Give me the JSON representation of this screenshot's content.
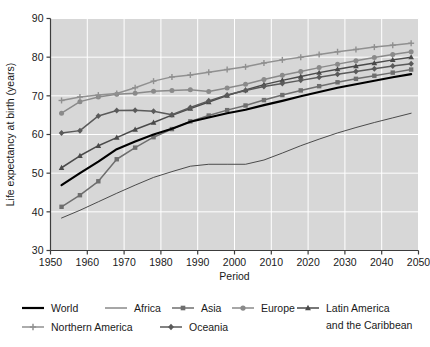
{
  "chart_data": {
    "type": "line",
    "title": "",
    "xlabel": "Period",
    "ylabel": "Life expectancy at birth (years)",
    "xlim": [
      1950,
      2050
    ],
    "ylim": [
      30,
      90
    ],
    "xticks": [
      1950,
      1960,
      1970,
      1980,
      1990,
      2000,
      2010,
      2020,
      2030,
      2040,
      2050
    ],
    "yticks": [
      30,
      40,
      50,
      60,
      70,
      80,
      90
    ],
    "grid": true,
    "legend_position": "bottom",
    "x": [
      1953,
      1958,
      1963,
      1968,
      1973,
      1978,
      1983,
      1988,
      1993,
      1998,
      2003,
      2008,
      2013,
      2018,
      2023,
      2028,
      2033,
      2038,
      2043,
      2048
    ],
    "series": [
      {
        "name": "World",
        "marker": "none",
        "color": "#000000",
        "width": 2.2,
        "values": [
          46.9,
          50.0,
          53.0,
          56.2,
          58.2,
          60.0,
          61.5,
          63.3,
          64.4,
          65.5,
          66.4,
          67.6,
          68.7,
          69.9,
          71.0,
          72.1,
          73.0,
          73.9,
          74.8,
          75.6
        ]
      },
      {
        "name": "Africa",
        "marker": "none",
        "color": "#3a3a3a",
        "width": 0.9,
        "values": [
          38.4,
          40.4,
          42.6,
          44.8,
          46.9,
          48.9,
          50.4,
          51.8,
          52.3,
          52.3,
          52.3,
          53.4,
          55.2,
          57.1,
          58.8,
          60.4,
          61.8,
          63.1,
          64.3,
          65.5
        ]
      },
      {
        "name": "Asia",
        "marker": "square",
        "color": "#6e6e6e",
        "width": 1.5,
        "values": [
          41.3,
          44.3,
          47.9,
          53.6,
          56.6,
          59.3,
          61.4,
          63.4,
          64.9,
          66.3,
          67.5,
          68.9,
          70.2,
          71.4,
          72.5,
          73.5,
          74.4,
          75.2,
          76.0,
          76.8
        ]
      },
      {
        "name": "Europe",
        "marker": "circle",
        "color": "#8a8a8a",
        "width": 1.5,
        "values": [
          65.5,
          68.5,
          69.7,
          70.4,
          70.7,
          71.2,
          71.4,
          71.6,
          71.1,
          72.0,
          73.0,
          74.2,
          75.3,
          76.3,
          77.3,
          78.2,
          79.1,
          79.9,
          80.7,
          81.4
        ]
      },
      {
        "name": "Latin America\nand the Caribbean",
        "marker": "triangle",
        "color": "#4a4a4a",
        "width": 1.5,
        "values": [
          51.4,
          54.5,
          57.1,
          59.2,
          61.3,
          63.1,
          65.0,
          66.7,
          68.4,
          70.1,
          71.5,
          72.9,
          74.0,
          75.0,
          76.0,
          76.9,
          77.7,
          78.5,
          79.3,
          80.0
        ]
      },
      {
        "name": "Northern America",
        "marker": "plus",
        "color": "#909090",
        "width": 1.5,
        "values": [
          68.8,
          69.7,
          70.2,
          70.6,
          72.1,
          73.8,
          74.9,
          75.4,
          76.1,
          76.8,
          77.5,
          78.5,
          79.3,
          80.0,
          80.7,
          81.4,
          82.0,
          82.6,
          83.1,
          83.6
        ]
      },
      {
        "name": "Oceania",
        "marker": "diamond",
        "color": "#5a5a5a",
        "width": 1.5,
        "values": [
          60.4,
          61.0,
          64.8,
          66.2,
          66.3,
          66.0,
          65.1,
          67.0,
          68.7,
          70.2,
          71.4,
          72.4,
          73.2,
          74.0,
          74.8,
          75.6,
          76.3,
          77.0,
          77.7,
          78.3
        ]
      }
    ]
  },
  "legend": {
    "items": [
      {
        "label": "World",
        "marker": "none",
        "color": "#000000",
        "width": 2.2
      },
      {
        "label": "Africa",
        "marker": "none",
        "color": "#3a3a3a",
        "width": 0.9
      },
      {
        "label": "Asia",
        "marker": "square",
        "color": "#6e6e6e",
        "width": 1.5
      },
      {
        "label": "Europe",
        "marker": "circle",
        "color": "#8a8a8a",
        "width": 1.5
      },
      {
        "label": "Latin America",
        "label2": "and the Caribbean",
        "marker": "triangle",
        "color": "#4a4a4a",
        "width": 1.5
      },
      {
        "label": "Northern America",
        "marker": "plus",
        "color": "#909090",
        "width": 1.5
      },
      {
        "label": "Oceania",
        "marker": "diamond",
        "color": "#5a5a5a",
        "width": 1.5
      }
    ]
  },
  "style": {
    "plot_background": "#d7d7d7",
    "grid_color": "#ffffff",
    "axis_color": "#3c3c3c",
    "page_background": "#ffffff"
  }
}
